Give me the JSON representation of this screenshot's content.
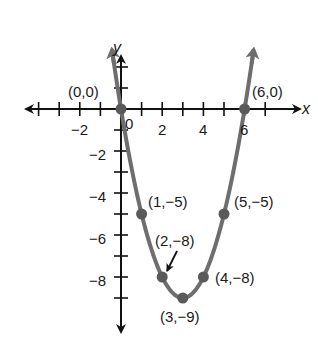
{
  "chart_data": {
    "type": "line",
    "title": "",
    "xlabel": "x",
    "ylabel": "y",
    "function": "y = x^2 - 6x",
    "xlim": [
      -4,
      8.5
    ],
    "ylim": [
      -10.5,
      3
    ],
    "x_ticks": [
      -4,
      -3,
      -2,
      -1,
      0,
      1,
      2,
      3,
      4,
      5,
      6,
      7
    ],
    "x_tick_labels": [
      "-2",
      "0",
      "2",
      "4",
      "6"
    ],
    "x_tick_label_values": [
      -2,
      0,
      2,
      4,
      6
    ],
    "y_ticks": [
      2,
      1,
      -1,
      -2,
      -3,
      -4,
      -5,
      -6,
      -7,
      -8,
      -9
    ],
    "y_tick_labels": [
      "-2",
      "-4",
      "-6",
      "-8"
    ],
    "y_tick_label_values": [
      -2,
      -4,
      -6,
      -8
    ],
    "grid": false,
    "series": [
      {
        "name": "parabola",
        "color": "#6e6e6e",
        "curve_x_range": [
          -0.42,
          6.42
        ],
        "points": [
          {
            "x": 0,
            "y": 0,
            "label": "(0,0)"
          },
          {
            "x": 1,
            "y": -5,
            "label": "(1,−5)"
          },
          {
            "x": 2,
            "y": -8,
            "label": "(2,−8)"
          },
          {
            "x": 3,
            "y": -9,
            "label": "(3,−9)"
          },
          {
            "x": 4,
            "y": -8,
            "label": "(4,−8)"
          },
          {
            "x": 5,
            "y": -5,
            "label": "(5,−5)"
          },
          {
            "x": 6,
            "y": 0,
            "label": "(6,0)"
          }
        ]
      }
    ],
    "annotations": [
      {
        "text": "(0,0)",
        "x": 0,
        "y": 0
      },
      {
        "text": "(6,0)",
        "x": 6,
        "y": 0
      },
      {
        "text": "(1,−5)",
        "x": 1,
        "y": -5
      },
      {
        "text": "(5,−5)",
        "x": 5,
        "y": -5
      },
      {
        "text": "(2,−8)",
        "x": 2,
        "y": -8,
        "arrow": true
      },
      {
        "text": "(4,−8)",
        "x": 4,
        "y": -8
      },
      {
        "text": "(3,−9)",
        "x": 3,
        "y": -9
      }
    ],
    "colors": {
      "axis": "#111111",
      "curve": "#6e6e6e",
      "point": "#5a5a5a",
      "text": "#1a1a1a"
    }
  },
  "labels": {
    "x_axis": "x",
    "y_axis": "y",
    "x_tick_neg2": "−2",
    "x_tick_0": "0",
    "x_tick_2": "2",
    "x_tick_4": "4",
    "x_tick_6": "6",
    "y_tick_neg2": "−2",
    "y_tick_neg4": "−4",
    "y_tick_neg6": "−6",
    "y_tick_neg8": "−8",
    "pt_0_0": "(0,0)",
    "pt_6_0": "(6,0)",
    "pt_1_neg5": "(1,−5)",
    "pt_5_neg5": "(5,−5)",
    "pt_2_neg8": "(2,−8)",
    "pt_4_neg8": "(4,−8)",
    "pt_3_neg9": "(3,−9)"
  }
}
